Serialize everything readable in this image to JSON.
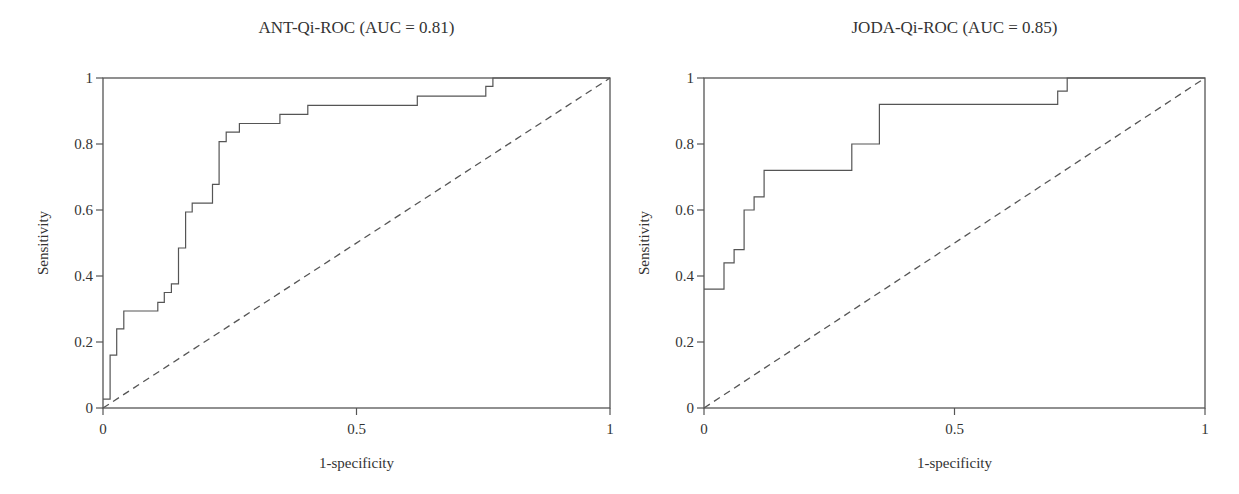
{
  "chart_data": [
    {
      "type": "line",
      "title": "ANT-Qi-ROC (AUC = 0.81)",
      "xlabel": "1-specificity",
      "ylabel": "Sensitivity",
      "xlim": [
        0,
        1
      ],
      "ylim": [
        0,
        1
      ],
      "xticks": [
        "0",
        "0.5",
        "1"
      ],
      "xtick_values": [
        0,
        0.5,
        1
      ],
      "yticks": [
        "0",
        "0.2",
        "0.4",
        "0.6",
        "0.8",
        "1"
      ],
      "ytick_values": [
        0,
        0.2,
        0.4,
        0.6,
        0.8,
        1
      ],
      "grid": false,
      "auc": 0.81,
      "series": [
        {
          "name": "ROC curve",
          "style": "step",
          "x": [
            0,
            0.014,
            0.014,
            0.027,
            0.027,
            0.041,
            0.041,
            0.108,
            0.108,
            0.121,
            0.121,
            0.135,
            0.135,
            0.149,
            0.149,
            0.163,
            0.163,
            0.176,
            0.176,
            0.216,
            0.216,
            0.229,
            0.229,
            0.243,
            0.243,
            0.269,
            0.269,
            0.349,
            0.349,
            0.404,
            0.404,
            0.62,
            0.62,
            0.755,
            0.755,
            0.769,
            0.769,
            1.0
          ],
          "y": [
            0.027,
            0.027,
            0.16,
            0.16,
            0.24,
            0.24,
            0.294,
            0.294,
            0.32,
            0.32,
            0.35,
            0.35,
            0.376,
            0.376,
            0.485,
            0.485,
            0.594,
            0.594,
            0.621,
            0.621,
            0.678,
            0.678,
            0.807,
            0.807,
            0.836,
            0.836,
            0.862,
            0.862,
            0.89,
            0.89,
            0.917,
            0.917,
            0.945,
            0.945,
            0.975,
            0.975,
            1.0,
            1.0
          ]
        },
        {
          "name": "Reference (chance)",
          "style": "dashed",
          "x": [
            0,
            1
          ],
          "y": [
            0,
            1
          ]
        }
      ]
    },
    {
      "type": "line",
      "title": "JODA-Qi-ROC (AUC = 0.85)",
      "xlabel": "1-specificity",
      "ylabel": "Sensitivity",
      "xlim": [
        0,
        1
      ],
      "ylim": [
        0,
        1
      ],
      "xticks": [
        "0",
        "0.5",
        "1"
      ],
      "xtick_values": [
        0,
        0.5,
        1
      ],
      "yticks": [
        "0",
        "0.2",
        "0.4",
        "0.6",
        "0.8",
        "1"
      ],
      "ytick_values": [
        0,
        0.2,
        0.4,
        0.6,
        0.8,
        1
      ],
      "grid": false,
      "auc": 0.85,
      "series": [
        {
          "name": "ROC curve",
          "style": "step",
          "x": [
            0,
            0.04,
            0.04,
            0.06,
            0.06,
            0.08,
            0.08,
            0.1,
            0.1,
            0.12,
            0.12,
            0.295,
            0.295,
            0.35,
            0.35,
            0.706,
            0.706,
            0.725,
            0.725,
            1.0
          ],
          "y": [
            0.36,
            0.36,
            0.44,
            0.44,
            0.48,
            0.48,
            0.6,
            0.6,
            0.64,
            0.64,
            0.72,
            0.72,
            0.8,
            0.8,
            0.92,
            0.92,
            0.96,
            0.96,
            1.0,
            1.0
          ]
        },
        {
          "name": "Reference (chance)",
          "style": "dashed",
          "x": [
            0,
            1
          ],
          "y": [
            0,
            1
          ]
        }
      ]
    }
  ],
  "layout": {
    "panels": [
      {
        "plot_left": 103,
        "plot_right": 610,
        "plot_top": 78,
        "plot_bottom": 408
      },
      {
        "plot_left": 84,
        "plot_right": 585,
        "plot_top": 78,
        "plot_bottom": 408
      }
    ],
    "line_color": "#555555"
  }
}
